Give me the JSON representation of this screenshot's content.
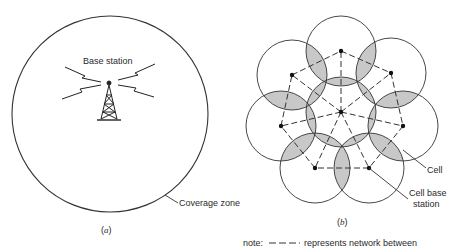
{
  "panel_a": {
    "label_base_station": "Base station",
    "label_coverage_zone": "Coverage zone",
    "caption_open": "(",
    "caption_letter": "a",
    "caption_close": ")",
    "coverage_circle": {
      "cx": 110,
      "cy": 114,
      "r": 98
    }
  },
  "panel_b": {
    "label_cell": "Cell",
    "label_cell_base_line1": "Cell base",
    "label_cell_base_line2": "station",
    "caption_open": "(",
    "caption_letter": "b",
    "caption_close": ")",
    "hub_node": {
      "x": 341,
      "y": 112
    },
    "cell_radius": 35,
    "outer_nodes": [
      {
        "x": 341,
        "y": 51
      },
      {
        "x": 391,
        "y": 73
      },
      {
        "x": 403,
        "y": 126
      },
      {
        "x": 369,
        "y": 168
      },
      {
        "x": 315,
        "y": 168
      },
      {
        "x": 281,
        "y": 126
      },
      {
        "x": 292,
        "y": 75
      }
    ],
    "overlap_fill": "#c8c8c8",
    "line_color": "#333333"
  },
  "note": {
    "prefix": "note:",
    "dash_symbol": "— — —",
    "text": "represents network between"
  }
}
